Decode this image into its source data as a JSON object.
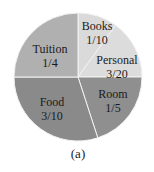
{
  "chart_data": {
    "type": "pie",
    "title": "",
    "caption": "(a)",
    "start_angle_deg": 0,
    "direction": "clockwise",
    "slices": [
      {
        "name": "Books",
        "fraction_label": "1/10",
        "value": 0.1,
        "color": "#dadada",
        "label_pos": [
          97,
          26
        ]
      },
      {
        "name": "Personal",
        "fraction_label": "3/20",
        "value": 0.15,
        "color": "#dcdcdc",
        "label_pos": [
          117,
          60
        ]
      },
      {
        "name": "Room",
        "fraction_label": "1/5",
        "value": 0.2,
        "color": "#8f8f8f",
        "label_pos": [
          113,
          94
        ]
      },
      {
        "name": "Food",
        "fraction_label": "3/10",
        "value": 0.3,
        "color": "#8a8a8a",
        "label_pos": [
          52,
          102
        ]
      },
      {
        "name": "Tuition",
        "fraction_label": "1/4",
        "value": 0.25,
        "color": "#b0b0b0",
        "label_pos": [
          50,
          49
        ]
      }
    ],
    "categories": [
      "Books",
      "Personal",
      "Room",
      "Food",
      "Tuition"
    ],
    "values": [
      0.1,
      0.15,
      0.2,
      0.3,
      0.25
    ],
    "legend": "none (labels inside slices)",
    "center": [
      78,
      77
    ],
    "radius": 64,
    "separator_color": "#f2f2f2"
  }
}
